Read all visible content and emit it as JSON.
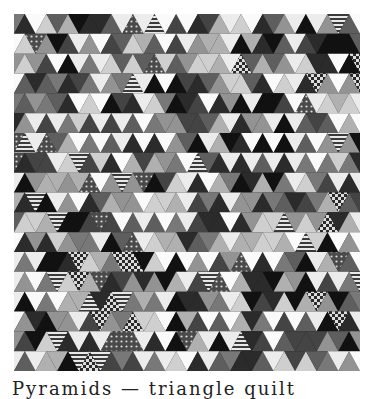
{
  "quilt": {
    "rows": 18,
    "cols": 32,
    "width": 346,
    "height": 357,
    "palette": [
      "#111111",
      "#2b2b2b",
      "#444444",
      "#5e5e5e",
      "#787878",
      "#939393",
      "#b0b0b0",
      "#cfcfcf",
      "#ececec",
      "#fafafa"
    ],
    "patterns": [
      "solid",
      "stripes",
      "checks",
      "dots"
    ]
  },
  "caption": {
    "text": "Pyramids — triangle quilt"
  }
}
